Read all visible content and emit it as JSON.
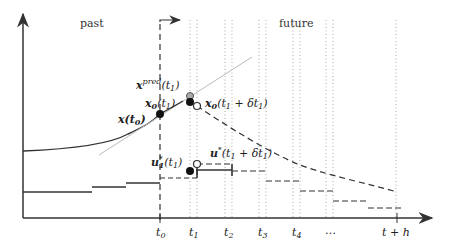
{
  "diagram": {
    "regions": {
      "past": "past",
      "future": "future"
    },
    "labels": {
      "x_t0": "x(t0)",
      "x_pred_t1": "xpred(t1)",
      "x0_t1": "x0(t1)",
      "x0_t1_dt": "x0(t1 + δt1)",
      "u_star_t1": "u*1(t1)",
      "u_star_t1_dt": "u*(t1 + δt1)"
    },
    "axis_ticks": [
      "t0",
      "t1",
      "t2",
      "t3",
      "t4",
      "…",
      "t + h"
    ],
    "colors": {
      "line": "#333333",
      "tangent": "#bbbbbb",
      "dotted": "#aaaaaa"
    }
  }
}
